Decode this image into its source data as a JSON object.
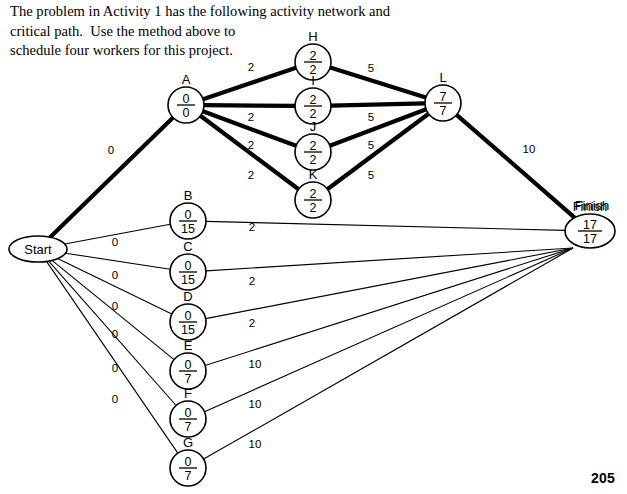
{
  "page": {
    "number": "205",
    "prompt_lines": [
      "The problem in Activity 1 has the following activity network and",
      "critical path.  Use the method above to",
      "schedule four workers for this project."
    ]
  },
  "diagram": {
    "type": "activity-network-critical-path",
    "node_value_format": "earliest / latest",
    "nodes": [
      {
        "id": "start",
        "label": "Start",
        "shape": "ellipse",
        "top": "",
        "bottom": "",
        "text": "Start",
        "cx": 38,
        "cy": 249,
        "rx": 29,
        "ry": 13,
        "on_critical_path": true
      },
      {
        "id": "A",
        "label": "A",
        "shape": "circle",
        "top": "0",
        "bottom": "0",
        "text": "",
        "cx": 186,
        "cy": 105,
        "rx": 18,
        "ry": 18,
        "on_critical_path": true
      },
      {
        "id": "H",
        "label": "H",
        "shape": "circle",
        "top": "2",
        "bottom": "2",
        "text": "",
        "cx": 313,
        "cy": 62,
        "rx": 18,
        "ry": 18,
        "on_critical_path": true
      },
      {
        "id": "I",
        "label": "I",
        "shape": "circle",
        "top": "2",
        "bottom": "2",
        "text": "",
        "cx": 313,
        "cy": 106,
        "rx": 18,
        "ry": 18,
        "on_critical_path": true
      },
      {
        "id": "J",
        "label": "J",
        "shape": "circle",
        "top": "2",
        "bottom": "2",
        "text": "",
        "cx": 313,
        "cy": 152,
        "rx": 18,
        "ry": 18,
        "on_critical_path": true
      },
      {
        "id": "K",
        "label": "K",
        "shape": "circle",
        "top": "2",
        "bottom": "2",
        "text": "",
        "cx": 313,
        "cy": 200,
        "rx": 18,
        "ry": 18,
        "on_critical_path": true
      },
      {
        "id": "L",
        "label": "L",
        "shape": "circle",
        "top": "7",
        "bottom": "7",
        "text": "",
        "cx": 443,
        "cy": 103,
        "rx": 18,
        "ry": 18,
        "on_critical_path": true
      },
      {
        "id": "B",
        "label": "B",
        "shape": "circle",
        "top": "0",
        "bottom": "15",
        "text": "",
        "cx": 188,
        "cy": 221,
        "rx": 18,
        "ry": 18,
        "on_critical_path": false
      },
      {
        "id": "C",
        "label": "C",
        "shape": "circle",
        "top": "0",
        "bottom": "15",
        "text": "",
        "cx": 188,
        "cy": 272,
        "rx": 18,
        "ry": 18,
        "on_critical_path": false
      },
      {
        "id": "D",
        "label": "D",
        "shape": "circle",
        "top": "0",
        "bottom": "15",
        "text": "",
        "cx": 188,
        "cy": 322,
        "rx": 18,
        "ry": 18,
        "on_critical_path": false
      },
      {
        "id": "E",
        "label": "E",
        "shape": "circle",
        "top": "0",
        "bottom": "7",
        "text": "",
        "cx": 188,
        "cy": 371,
        "rx": 18,
        "ry": 18,
        "on_critical_path": false
      },
      {
        "id": "F",
        "label": "F",
        "shape": "circle",
        "top": "0",
        "bottom": "7",
        "text": "",
        "cx": 188,
        "cy": 419,
        "rx": 18,
        "ry": 18,
        "on_critical_path": false
      },
      {
        "id": "G",
        "label": "G",
        "shape": "circle",
        "top": "0",
        "bottom": "7",
        "text": "",
        "cx": 188,
        "cy": 468,
        "rx": 18,
        "ry": 18,
        "on_critical_path": false
      },
      {
        "id": "finish",
        "label": "Finish",
        "shape": "ellipse",
        "top": "17",
        "bottom": "17",
        "text": "",
        "cx": 590,
        "cy": 231,
        "rx": 25,
        "ry": 17,
        "on_critical_path": true
      }
    ],
    "edges": [
      {
        "from": "start",
        "to": "A",
        "weight": "0",
        "critical": true,
        "lx": 111,
        "ly": 154
      },
      {
        "from": "A",
        "to": "H",
        "weight": "2",
        "critical": true,
        "lx": 251,
        "ly": 71
      },
      {
        "from": "A",
        "to": "I",
        "weight": "2",
        "critical": true,
        "lx": 251,
        "ly": 121
      },
      {
        "from": "A",
        "to": "J",
        "weight": "2",
        "critical": true,
        "lx": 251,
        "ly": 149
      },
      {
        "from": "A",
        "to": "K",
        "weight": "2",
        "critical": true,
        "lx": 251,
        "ly": 179
      },
      {
        "from": "H",
        "to": "L",
        "weight": "5",
        "critical": true,
        "lx": 371,
        "ly": 72
      },
      {
        "from": "I",
        "to": "L",
        "weight": "5",
        "critical": true,
        "lx": 371,
        "ly": 121
      },
      {
        "from": "J",
        "to": "L",
        "weight": "5",
        "critical": true,
        "lx": 371,
        "ly": 149
      },
      {
        "from": "K",
        "to": "L",
        "weight": "5",
        "critical": true,
        "lx": 371,
        "ly": 179
      },
      {
        "from": "L",
        "to": "finish",
        "weight": "10",
        "critical": true,
        "lx": 529,
        "ly": 153
      },
      {
        "from": "start",
        "to": "B",
        "weight": "0",
        "critical": false,
        "lx": 115,
        "ly": 246
      },
      {
        "from": "start",
        "to": "C",
        "weight": "0",
        "critical": false,
        "lx": 115,
        "ly": 279
      },
      {
        "from": "start",
        "to": "D",
        "weight": "0",
        "critical": false,
        "lx": 115,
        "ly": 310
      },
      {
        "from": "start",
        "to": "E",
        "weight": "0",
        "critical": false,
        "lx": 115,
        "ly": 338
      },
      {
        "from": "start",
        "to": "F",
        "weight": "0",
        "critical": false,
        "lx": 115,
        "ly": 372
      },
      {
        "from": "start",
        "to": "G",
        "weight": "0",
        "critical": false,
        "lx": 115,
        "ly": 403
      },
      {
        "from": "B",
        "to": "finish",
        "weight": "2",
        "critical": false,
        "lx": 252,
        "ly": 231
      },
      {
        "from": "C",
        "to": "finish",
        "weight": "2",
        "critical": false,
        "lx": 252,
        "ly": 285
      },
      {
        "from": "D",
        "to": "finish",
        "weight": "2",
        "critical": false,
        "lx": 252,
        "ly": 327
      },
      {
        "from": "E",
        "to": "finish",
        "weight": "10",
        "critical": false,
        "lx": 255,
        "ly": 368
      },
      {
        "from": "F",
        "to": "finish",
        "weight": "10",
        "critical": false,
        "lx": 255,
        "ly": 408
      },
      {
        "from": "G",
        "to": "finish",
        "weight": "10",
        "critical": false,
        "lx": 255,
        "ly": 448
      }
    ]
  }
}
